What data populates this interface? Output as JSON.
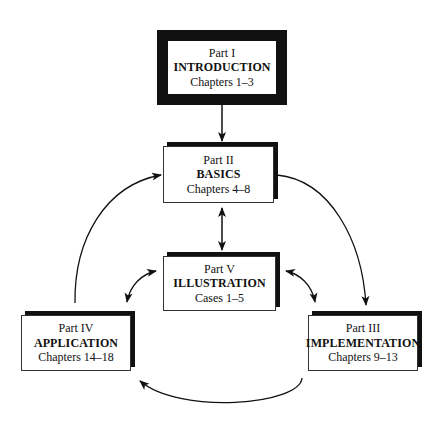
{
  "diagram": {
    "nodes": [
      {
        "id": "intro",
        "part": "Part I",
        "title": "INTRODUCTION",
        "range": "Chapters 1–3"
      },
      {
        "id": "basics",
        "part": "Part II",
        "title": "BASICS",
        "range": "Chapters 4–8"
      },
      {
        "id": "illustration",
        "part": "Part V",
        "title": "ILLUSTRATION",
        "range": "Cases 1–5"
      },
      {
        "id": "application",
        "part": "Part IV",
        "title": "APPLICATION",
        "range": "Chapters 14–18"
      },
      {
        "id": "implementation",
        "part": "Part III",
        "title": "IMPLEMENTATION",
        "range": "Chapters 9–13"
      }
    ],
    "edges": [
      {
        "from": "intro",
        "to": "basics",
        "direction": "one-way"
      },
      {
        "from": "basics",
        "to": "illustration",
        "direction": "two-way"
      },
      {
        "from": "basics",
        "to": "implementation",
        "direction": "one-way"
      },
      {
        "from": "implementation",
        "to": "application",
        "direction": "one-way"
      },
      {
        "from": "application",
        "to": "basics",
        "direction": "one-way"
      },
      {
        "from": "illustration",
        "to": "application",
        "direction": "two-way"
      },
      {
        "from": "illustration",
        "to": "implementation",
        "direction": "two-way"
      }
    ],
    "colors": {
      "ink": "#111111",
      "background": "#ffffff"
    }
  }
}
